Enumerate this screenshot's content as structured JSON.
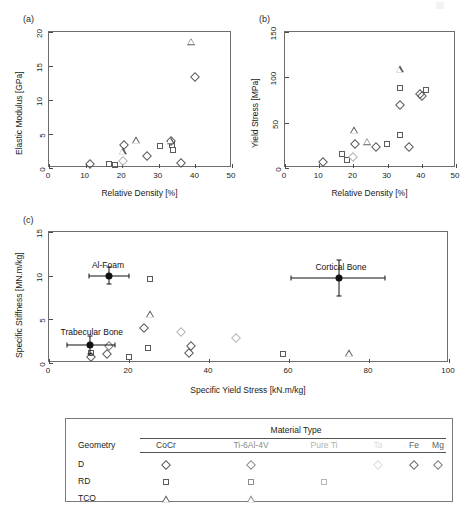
{
  "figure": {
    "background": "#ffffff",
    "marker_colors": {
      "CoCr": "#5a5a5a",
      "Ti-6Al-4V": "#8d8d8d",
      "Pure Ti": "#b4b4b4",
      "Ta": "#d8d8d8",
      "Fe": "#707070",
      "Mg": "#7c7c7c",
      "reference": "#111111"
    }
  },
  "chart_data": [
    {
      "id": "panel_a",
      "type": "scatter",
      "panel_label": "(a)",
      "title": "",
      "xlabel": "Relative Density [%]",
      "ylabel": "Elastic Modulus [GPa]",
      "xlim": [
        0,
        50
      ],
      "ylim": [
        0,
        20
      ],
      "xticks": [
        0,
        10,
        20,
        30,
        40,
        50
      ],
      "yticks": [
        0,
        5,
        10,
        15,
        20
      ],
      "grid": false,
      "legend": "external-table",
      "series": [
        {
          "name": "D / CoCr",
          "geometry": "D",
          "material": "CoCr",
          "marker": "diamond",
          "color": "#5a5a5a",
          "points": [
            {
              "x": 11.2,
              "y": 0.55
            },
            {
              "x": 20.6,
              "y": 3.35
            },
            {
              "x": 26.8,
              "y": 1.8
            },
            {
              "x": 33.4,
              "y": 3.9
            },
            {
              "x": 36.1,
              "y": 0.8
            },
            {
              "x": 39.9,
              "y": 13.4
            }
          ]
        },
        {
          "name": "RD / CoCr",
          "geometry": "RD",
          "material": "CoCr",
          "marker": "square",
          "color": "#5a5a5a",
          "points": [
            {
              "x": 16.5,
              "y": 0.55
            },
            {
              "x": 18.1,
              "y": 0.5
            },
            {
              "x": 30.2,
              "y": 3.2
            },
            {
              "x": 33.6,
              "y": 3.4
            },
            {
              "x": 33.9,
              "y": 2.7
            }
          ]
        },
        {
          "name": "TCO / CoCr",
          "geometry": "TCO",
          "material": "CoCr",
          "marker": "triangle",
          "color": "#5a5a5a",
          "points": [
            {
              "x": 20.1,
              "y": 2.5
            },
            {
              "x": 23.8,
              "y": 4.1
            },
            {
              "x": 33.2,
              "y": 4.0
            },
            {
              "x": 38.7,
              "y": 18.6
            }
          ]
        },
        {
          "name": "D / Pure Ti",
          "geometry": "D",
          "material": "Pure Ti",
          "marker": "diamond",
          "color": "#b4b4b4",
          "points": [
            {
              "x": 20.2,
              "y": 1.1
            }
          ]
        }
      ]
    },
    {
      "id": "panel_b",
      "type": "scatter",
      "panel_label": "(b)",
      "title": "",
      "xlabel": "Relative Density [%]",
      "ylabel": "Yield Stress [MPa]",
      "xlim": [
        0,
        50
      ],
      "ylim": [
        0,
        150
      ],
      "xticks": [
        0,
        10,
        20,
        30,
        40,
        50
      ],
      "yticks": [
        0,
        50,
        100,
        150
      ],
      "grid": false,
      "legend": "external-table",
      "series": [
        {
          "name": "D / CoCr",
          "geometry": "D",
          "material": "CoCr",
          "marker": "diamond",
          "color": "#5a5a5a",
          "points": [
            {
              "x": 11.0,
              "y": 7
            },
            {
              "x": 20.4,
              "y": 26
            },
            {
              "x": 26.6,
              "y": 23
            },
            {
              "x": 33.6,
              "y": 70
            },
            {
              "x": 36.2,
              "y": 23
            },
            {
              "x": 39.4,
              "y": 82
            },
            {
              "x": 40.2,
              "y": 79
            }
          ]
        },
        {
          "name": "RD / CoCr",
          "geometry": "RD",
          "material": "CoCr",
          "marker": "square",
          "color": "#5a5a5a",
          "points": [
            {
              "x": 16.6,
              "y": 15
            },
            {
              "x": 18.2,
              "y": 9
            },
            {
              "x": 29.9,
              "y": 27
            },
            {
              "x": 33.6,
              "y": 36
            },
            {
              "x": 33.5,
              "y": 88
            },
            {
              "x": 41.1,
              "y": 86
            }
          ]
        },
        {
          "name": "TCO / CoCr",
          "geometry": "TCO",
          "material": "CoCr",
          "marker": "triangle",
          "color": "#5a5a5a",
          "points": [
            {
              "x": 20.3,
              "y": 42
            },
            {
              "x": 23.9,
              "y": 29
            },
            {
              "x": 33.5,
              "y": 109
            }
          ]
        },
        {
          "name": "D / Pure Ti",
          "geometry": "D",
          "material": "Pure Ti",
          "marker": "diamond",
          "color": "#b4b4b4",
          "points": [
            {
              "x": 19.9,
              "y": 12
            }
          ]
        }
      ]
    },
    {
      "id": "panel_c",
      "type": "scatter",
      "panel_label": "(c)",
      "title": "",
      "xlabel": "Specific Yield Stress [kN.m/kg]",
      "ylabel": "Specific Stiffness [MN.m/kg]",
      "xlim": [
        0,
        100
      ],
      "ylim": [
        0,
        15
      ],
      "xticks": [
        0,
        20,
        40,
        60,
        80,
        100
      ],
      "yticks": [
        0,
        5,
        10,
        15
      ],
      "grid": false,
      "legend": "external-table",
      "series": [
        {
          "name": "D / CoCr",
          "geometry": "D",
          "material": "CoCr",
          "marker": "diamond",
          "color": "#5a5a5a",
          "points": [
            {
              "x": 10.6,
              "y": 0.7
            },
            {
              "x": 14.4,
              "y": 1.0
            },
            {
              "x": 23.8,
              "y": 4.0
            },
            {
              "x": 35.1,
              "y": 1.1
            },
            {
              "x": 35.4,
              "y": 2.0
            }
          ]
        },
        {
          "name": "RD / CoCr",
          "geometry": "RD",
          "material": "CoCr",
          "marker": "square",
          "color": "#5a5a5a",
          "points": [
            {
              "x": 10.4,
              "y": 1.1
            },
            {
              "x": 19.9,
              "y": 0.65
            },
            {
              "x": 24.7,
              "y": 1.7
            },
            {
              "x": 25.3,
              "y": 9.6
            },
            {
              "x": 58.6,
              "y": 1.0
            }
          ]
        },
        {
          "name": "TCO / CoCr",
          "geometry": "TCO",
          "material": "CoCr",
          "marker": "triangle",
          "color": "#5a5a5a",
          "points": [
            {
              "x": 25.2,
              "y": 5.6
            },
            {
              "x": 74.9,
              "y": 1.1
            }
          ]
        },
        {
          "name": "D / Pure Ti",
          "geometry": "D",
          "material": "Pure Ti",
          "marker": "diamond",
          "color": "#b4b4b4",
          "points": [
            {
              "x": 33.1,
              "y": 3.6
            },
            {
              "x": 46.8,
              "y": 2.9
            }
          ]
        },
        {
          "name": "D / Mg",
          "geometry": "D",
          "material": "Mg",
          "marker": "diamond",
          "color": "#7c7c7c",
          "points": [
            {
              "x": 14.9,
              "y": 2.0
            }
          ]
        }
      ],
      "reference_points": [
        {
          "label": "Al-Foam",
          "x": 15.0,
          "y": 10.0,
          "xerr_low": 10.0,
          "xerr_high": 20.0,
          "yerr_low": 9.0,
          "yerr_high": 11.0,
          "label_dx": -1,
          "label_dy": -16
        },
        {
          "label": "Trabecular Bone",
          "x": 10.2,
          "y": 2.05,
          "xerr_low": 4.5,
          "xerr_high": 16.5,
          "yerr_low": 1.0,
          "yerr_high": 3.1,
          "label_dx": 2,
          "label_dy": -18
        },
        {
          "label": "Cortical Bone",
          "x": 72.5,
          "y": 9.7,
          "xerr_low": 60.5,
          "xerr_high": 84.0,
          "yerr_low": 7.7,
          "yerr_high": 11.8,
          "label_dx": 2,
          "label_dy": -16
        }
      ]
    }
  ],
  "legend_table": {
    "group_header": "Material Type",
    "row_header": "Geometry",
    "columns": [
      {
        "label": "CoCr",
        "color": "#3c3c3c"
      },
      {
        "label": "Ti-6Al-4V",
        "color": "#8a8a8a"
      },
      {
        "label": "Pure Ti",
        "color": "#b0b0b0"
      },
      {
        "label": "Ta",
        "color": "#dadada"
      },
      {
        "label": "Fe",
        "color": "#5e5e5e"
      },
      {
        "label": "Mg",
        "color": "#5e5e5e"
      }
    ],
    "rows": [
      {
        "label": "D",
        "marker": "diamond",
        "cells": [
          {
            "material": "CoCr",
            "present": true,
            "color": "#5a5a5a"
          },
          {
            "material": "Ti-6Al-4V",
            "present": true,
            "color": "#8d8d8d"
          },
          {
            "material": "Pure Ti",
            "present": false,
            "color": "#b4b4b4"
          },
          {
            "material": "Ta",
            "present": true,
            "color": "#dcdcdc"
          },
          {
            "material": "Fe",
            "present": true,
            "color": "#6a6a6a"
          },
          {
            "material": "Mg",
            "present": true,
            "color": "#7c7c7c"
          }
        ]
      },
      {
        "label": "RD",
        "marker": "square",
        "cells": [
          {
            "material": "CoCr",
            "present": true,
            "color": "#5a5a5a"
          },
          {
            "material": "Ti-6Al-4V",
            "present": true,
            "color": "#8d8d8d"
          },
          {
            "material": "Pure Ti",
            "present": true,
            "color": "#b4b4b4"
          },
          {
            "material": "Ta",
            "present": false,
            "color": "#dcdcdc"
          },
          {
            "material": "Fe",
            "present": false,
            "color": "#6a6a6a"
          },
          {
            "material": "Mg",
            "present": false,
            "color": "#7c7c7c"
          }
        ]
      },
      {
        "label": "TCO",
        "marker": "triangle",
        "cells": [
          {
            "material": "CoCr",
            "present": true,
            "color": "#5a5a5a"
          },
          {
            "material": "Ti-6Al-4V",
            "present": true,
            "color": "#8d8d8d"
          },
          {
            "material": "Pure Ti",
            "present": false,
            "color": "#b4b4b4"
          },
          {
            "material": "Ta",
            "present": false,
            "color": "#dcdcdc"
          },
          {
            "material": "Fe",
            "present": false,
            "color": "#6a6a6a"
          },
          {
            "material": "Mg",
            "present": false,
            "color": "#7c7c7c"
          }
        ]
      }
    ]
  }
}
